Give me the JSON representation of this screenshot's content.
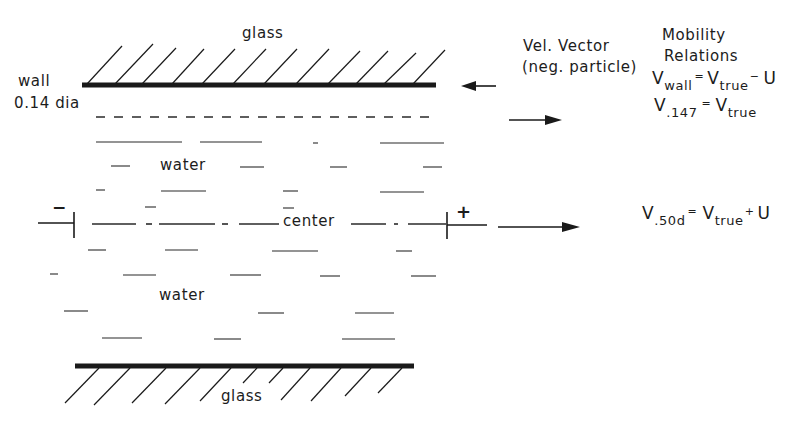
{
  "diagram": {
    "top_label": "glass",
    "bottom_label": "glass",
    "wall_label": "wall",
    "dia_label": "0.14 dia",
    "water_upper": "water",
    "water_lower": "water",
    "center_label": "center",
    "negative_electrode": "−",
    "positive_electrode": "+",
    "vel_vector": {
      "line1": "Vel. Vector",
      "line2": "(neg. particle)"
    },
    "mobility": {
      "line1": "Mobility",
      "line2": "Relations"
    },
    "relations": [
      {
        "lhs": "V",
        "lhs_sub": "wall",
        "eq": "=",
        "rhs": "V",
        "rhs_sub": "true",
        "op": "−",
        "term": "U"
      },
      {
        "lhs": "V",
        "lhs_sub": ".147",
        "eq": "=",
        "rhs": "V",
        "rhs_sub": "true",
        "op": "",
        "term": ""
      },
      {
        "lhs": "V",
        "lhs_sub": ".50d",
        "eq": "=",
        "rhs": "V",
        "rhs_sub": "true",
        "op": "+",
        "term": "U"
      }
    ],
    "arrows": [
      {
        "name": "wall-velocity-arrow",
        "direction": "left"
      },
      {
        "name": "stationary-layer-velocity-arrow",
        "direction": "right"
      },
      {
        "name": "center-velocity-arrow",
        "direction": "right"
      }
    ],
    "colors": {
      "ink": "#1a1a1a",
      "background": "#ffffff"
    }
  }
}
